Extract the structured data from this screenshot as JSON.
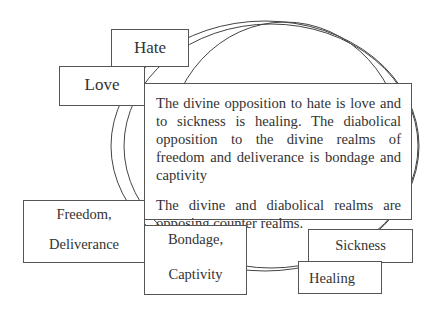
{
  "diagram": {
    "boxes": {
      "hate": "Hate",
      "love": "Love",
      "freedom": {
        "line1": "Freedom,",
        "line2": "Deliverance"
      },
      "bondage": {
        "line1": "Bondage,",
        "line2": "Captivity"
      },
      "sickness": "Sickness",
      "healing": "Healing"
    },
    "main_text": {
      "paragraph1": "The divine opposition to hate is love and to sickness is healing. The diabolical opposition to the divine realms of freedom and deliverance is bondage and captivity",
      "paragraph2": "The divine and diabolical realms are opposing counter realms."
    },
    "colors": {
      "stroke": "#555555",
      "text": "#333333",
      "background": "#ffffff"
    }
  }
}
